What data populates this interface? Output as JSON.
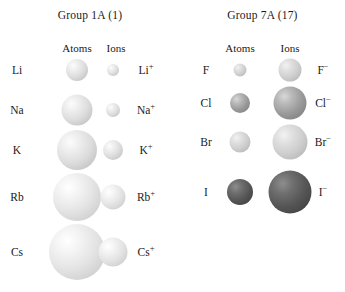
{
  "figure": {
    "title_semantic": "atomic-and-ionic-radii-comparison",
    "background": "#ffffff"
  },
  "panels": [
    {
      "id": "group-1a",
      "title": "Group 1A (1)",
      "columns": {
        "atoms": "Atoms",
        "ions": "Ions"
      },
      "rows": [
        {
          "element": "Li",
          "ion": "Li",
          "charge": "+",
          "atom_px": 22,
          "ion_px": 12,
          "atom_shade": "s-light",
          "ion_shade": "s-light",
          "y": 70
        },
        {
          "element": "Na",
          "ion": "Na",
          "charge": "+",
          "atom_px": 31,
          "ion_px": 14,
          "atom_shade": "s-light",
          "ion_shade": "s-light",
          "y": 110
        },
        {
          "element": "K",
          "ion": "K",
          "charge": "+",
          "atom_px": 40,
          "ion_px": 20,
          "atom_shade": "s-light",
          "ion_shade": "s-light",
          "y": 150
        },
        {
          "element": "Rb",
          "ion": "Rb",
          "charge": "+",
          "atom_px": 48,
          "ion_px": 25,
          "atom_shade": "s-vlight",
          "ion_shade": "s-vlight",
          "y": 197
        },
        {
          "element": "Cs",
          "ion": "Cs",
          "charge": "+",
          "atom_px": 56,
          "ion_px": 29,
          "atom_shade": "s-vlight",
          "ion_shade": "s-vlight",
          "y": 252
        }
      ]
    },
    {
      "id": "group-7a",
      "title": "Group 7A (17)",
      "columns": {
        "atoms": "Atoms",
        "ions": "Ions"
      },
      "rows": [
        {
          "element": "F",
          "ion": "F",
          "charge": "−",
          "atom_px": 13,
          "ion_px": 23,
          "atom_shade": "s-mlight",
          "ion_shade": "s-mlight",
          "y": 70
        },
        {
          "element": "Cl",
          "ion": "Cl",
          "charge": "−",
          "atom_px": 20,
          "ion_px": 33,
          "atom_shade": "s-med",
          "ion_shade": "s-med",
          "y": 103
        },
        {
          "element": "Br",
          "ion": "Br",
          "charge": "−",
          "atom_px": 21,
          "ion_px": 35,
          "atom_shade": "s-mlight",
          "ion_shade": "s-mlight",
          "y": 142
        },
        {
          "element": "I",
          "ion": "I",
          "charge": "−",
          "atom_px": 26,
          "ion_px": 43,
          "atom_shade": "s-dark",
          "ion_shade": "s-dark",
          "y": 192
        }
      ]
    }
  ],
  "chart_data": {
    "type": "diagram",
    "encoding": "sphere diameter in pixels represents relative radius",
    "groups": [
      {
        "group": "Group 1A (1)",
        "trend": "cations are smaller than their parent atoms; size increases down the group",
        "species": [
          {
            "atom": "Li",
            "ion": "Li+",
            "atom_diameter_px": 22,
            "ion_diameter_px": 12
          },
          {
            "atom": "Na",
            "ion": "Na+",
            "atom_diameter_px": 31,
            "ion_diameter_px": 14
          },
          {
            "atom": "K",
            "ion": "K+",
            "atom_diameter_px": 40,
            "ion_diameter_px": 20
          },
          {
            "atom": "Rb",
            "ion": "Rb+",
            "atom_diameter_px": 48,
            "ion_diameter_px": 25
          },
          {
            "atom": "Cs",
            "ion": "Cs+",
            "atom_diameter_px": 56,
            "ion_diameter_px": 29
          }
        ]
      },
      {
        "group": "Group 7A (17)",
        "trend": "anions are larger than their parent atoms; size increases down the group",
        "species": [
          {
            "atom": "F",
            "ion": "F-",
            "atom_diameter_px": 13,
            "ion_diameter_px": 23
          },
          {
            "atom": "Cl",
            "ion": "Cl-",
            "atom_diameter_px": 20,
            "ion_diameter_px": 33
          },
          {
            "atom": "Br",
            "ion": "Br-",
            "atom_diameter_px": 21,
            "ion_diameter_px": 35
          },
          {
            "atom": "I",
            "ion": "I-",
            "atom_diameter_px": 26,
            "ion_diameter_px": 43
          }
        ]
      }
    ]
  },
  "geometry": {
    "panel_1a": {
      "atom_cx": 77,
      "ion_cx": 113,
      "elem_lbl_x": 17,
      "ion_lbl_x": 146,
      "head_atoms_x": 77,
      "head_ions_x": 116,
      "head_y": 42
    },
    "panel_7a": {
      "atom_cx": 60,
      "ion_cx": 110,
      "elem_lbl_x": 26,
      "ion_lbl_x": 143,
      "head_atoms_x": 60,
      "head_ions_x": 110,
      "head_y": 42
    }
  }
}
